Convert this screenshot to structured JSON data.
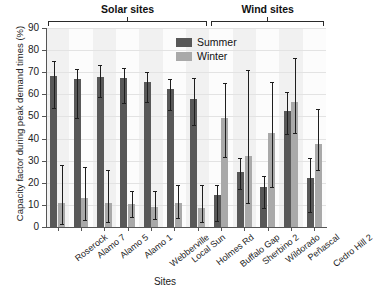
{
  "chart_data": {
    "type": "bar",
    "title": "",
    "xlabel": "Sites",
    "ylabel": "Capacity factor during peak demand times (%)",
    "ylim": [
      0,
      90
    ],
    "ytick_step": 10,
    "yticks": [
      0,
      10,
      20,
      30,
      40,
      50,
      60,
      70,
      80,
      90
    ],
    "grid": true,
    "legend_position": "top-center",
    "categories": [
      "Roserock",
      "Alamo 7",
      "Alamo 5",
      "Alamo 1",
      "Webberville",
      "Local Sun",
      "Holmes Rd",
      "Buffalo Gap",
      "Sherbino 2",
      "Wildorado",
      "Peñascal",
      "Cedro Hill 2"
    ],
    "groups": [
      {
        "label": "Solar sites",
        "start": 0,
        "end": 6
      },
      {
        "label": "Wind sites",
        "start": 7,
        "end": 11
      }
    ],
    "series": [
      {
        "name": "Summer",
        "color": "#585858",
        "values": [
          68.5,
          66.8,
          67.8,
          67.5,
          65.5,
          62.4,
          58.1,
          14.4,
          24.7,
          18.0,
          52.3,
          22.2
        ],
        "err_low": [
          53.8,
          49.4,
          58.8,
          56.0,
          56.5,
          52.8,
          46.0,
          2.8,
          17.2,
          8.4,
          42.2,
          6.8
        ],
        "err_high": [
          75.0,
          71.5,
          73.2,
          72.1,
          70.0,
          67.0,
          67.2,
          19.0,
          31.0,
          23.2,
          61.2,
          31.0
        ]
      },
      {
        "name": "Winter",
        "color": "#a9a9a9",
        "values": [
          11.0,
          13.0,
          10.8,
          10.4,
          9.2,
          10.8,
          8.8,
          49.5,
          32.0,
          42.3,
          56.5,
          37.5
        ],
        "err_low": [
          1.2,
          3.0,
          2.4,
          4.6,
          3.4,
          4.0,
          2.2,
          31.8,
          11.0,
          18.2,
          42.3,
          26.0
        ],
        "err_high": [
          28.2,
          27.0,
          25.6,
          16.2,
          16.4,
          18.8,
          18.8,
          65.2,
          71.0,
          65.8,
          76.5,
          53.2
        ]
      }
    ]
  },
  "legend": {
    "items": [
      {
        "label": "Summer",
        "swatch": "summer"
      },
      {
        "label": "Winter",
        "swatch": "winter"
      }
    ]
  },
  "colors": {
    "summer": "#585858",
    "winter": "#a9a9a9",
    "axis": "#555555",
    "grid": "#e3e3e3",
    "band": "#f1f1f1"
  }
}
